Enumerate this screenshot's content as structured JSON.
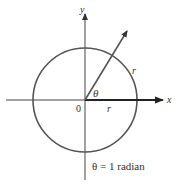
{
  "diagram": {
    "axis_x_label": "x",
    "axis_y_label": "y",
    "origin_label": "0",
    "angle_label": "θ",
    "arc_label": "r",
    "radius_label": "r",
    "caption": "θ = 1 radian",
    "colors": {
      "circle": "#555555",
      "axes": "#444444",
      "ray": "#555555",
      "radius_arrow": "#222222"
    }
  }
}
